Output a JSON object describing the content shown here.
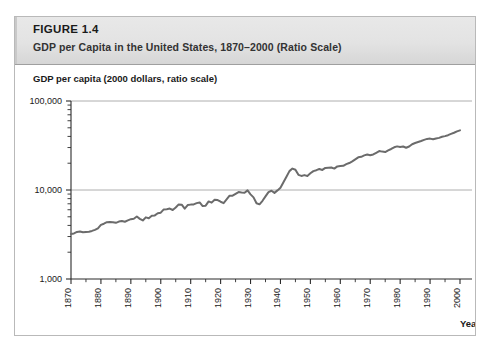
{
  "figure": {
    "label_prefix": "F",
    "label": "FIGURE 1.4",
    "title": "GDP per Capita in the United States, 1870–2000 (Ratio Scale)"
  },
  "chart_data": {
    "type": "line",
    "title": "GDP per Capita in the United States, 1870–2000 (Ratio Scale)",
    "ylabel": "GDP per capita (2000 dollars, ratio scale)",
    "xlabel": "Year",
    "scale": "log",
    "grid": true,
    "legend": "none",
    "xlim": [
      1870,
      2000
    ],
    "ylim": [
      1000,
      100000
    ],
    "ytick_labels": [
      "1,000",
      "10,000",
      "100,000"
    ],
    "ytick_values": [
      1000,
      10000,
      100000
    ],
    "xtick_labels": [
      "1870",
      "1880",
      "1890",
      "1900",
      "1910",
      "1920",
      "1930",
      "1940",
      "1950",
      "1960",
      "1970",
      "1980",
      "1990",
      "2000"
    ],
    "xtick_values": [
      1870,
      1880,
      1890,
      1900,
      1910,
      1920,
      1930,
      1940,
      1950,
      1960,
      1970,
      1980,
      1990,
      2000
    ],
    "line_color": "#6b6b6b",
    "series": [
      {
        "name": "GDP per capita (2000 dollars)",
        "x": [
          1870,
          1871,
          1872,
          1873,
          1874,
          1875,
          1876,
          1877,
          1878,
          1879,
          1880,
          1881,
          1882,
          1883,
          1884,
          1885,
          1886,
          1887,
          1888,
          1889,
          1890,
          1891,
          1892,
          1893,
          1894,
          1895,
          1896,
          1897,
          1898,
          1899,
          1900,
          1901,
          1902,
          1903,
          1904,
          1905,
          1906,
          1907,
          1908,
          1909,
          1910,
          1911,
          1912,
          1913,
          1914,
          1915,
          1916,
          1917,
          1918,
          1919,
          1920,
          1921,
          1922,
          1923,
          1924,
          1925,
          1926,
          1927,
          1928,
          1929,
          1930,
          1931,
          1932,
          1933,
          1934,
          1935,
          1936,
          1937,
          1938,
          1939,
          1940,
          1941,
          1942,
          1943,
          1944,
          1945,
          1946,
          1947,
          1948,
          1949,
          1950,
          1951,
          1952,
          1953,
          1954,
          1955,
          1956,
          1957,
          1958,
          1959,
          1960,
          1961,
          1962,
          1963,
          1964,
          1965,
          1966,
          1967,
          1968,
          1969,
          1970,
          1971,
          1972,
          1973,
          1974,
          1975,
          1976,
          1977,
          1978,
          1979,
          1980,
          1981,
          1982,
          1983,
          1984,
          1985,
          1986,
          1987,
          1988,
          1989,
          1990,
          1991,
          1992,
          1993,
          1994,
          1995,
          1996,
          1997,
          1998,
          1999,
          2000
        ],
        "values": [
          3200,
          3250,
          3380,
          3420,
          3350,
          3380,
          3400,
          3470,
          3560,
          3700,
          4050,
          4180,
          4350,
          4380,
          4350,
          4280,
          4420,
          4480,
          4400,
          4560,
          4700,
          4760,
          5030,
          4740,
          4550,
          4930,
          4820,
          5140,
          5180,
          5480,
          5560,
          6050,
          6080,
          6180,
          5960,
          6350,
          6890,
          6840,
          6180,
          6780,
          6850,
          6880,
          7120,
          7240,
          6600,
          6670,
          7440,
          7210,
          7760,
          7700,
          7380,
          7120,
          7830,
          8640,
          8630,
          9050,
          9470,
          9370,
          9300,
          9900,
          8930,
          8260,
          7090,
          6900,
          7560,
          8490,
          9480,
          9800,
          9280,
          9900,
          10600,
          12200,
          14100,
          16300,
          17400,
          16900,
          14800,
          14400,
          14700,
          14400,
          15400,
          16300,
          16700,
          17200,
          16800,
          17700,
          17800,
          17900,
          17400,
          18400,
          18600,
          18700,
          19500,
          20100,
          21000,
          22100,
          23300,
          23600,
          24500,
          25000,
          24600,
          25100,
          26200,
          27400,
          27000,
          26700,
          27900,
          28900,
          30200,
          30900,
          30400,
          30800,
          29800,
          30800,
          32700,
          33700,
          34600,
          35500,
          36600,
          37500,
          37800,
          37100,
          37900,
          38500,
          39700,
          40300,
          41300,
          42700,
          44000,
          45600,
          46800
        ]
      }
    ],
    "annotations": [
      {
        "label": "Great Depression trough",
        "x": 1933,
        "y": 6900
      },
      {
        "label": "World War II peak",
        "x": 1944,
        "y": 17400
      }
    ]
  }
}
